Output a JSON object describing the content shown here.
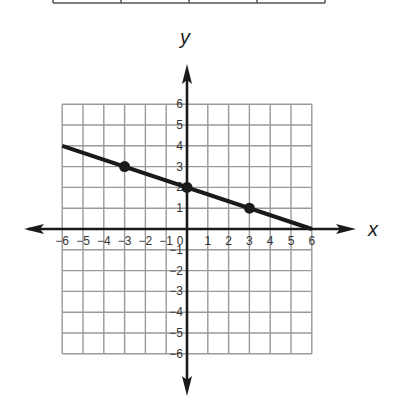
{
  "chart_data": {
    "type": "line",
    "title": "",
    "xlabel": "x",
    "ylabel": "y",
    "xlim": [
      -6,
      6
    ],
    "ylim": [
      -6,
      6
    ],
    "grid": true,
    "x_ticks": [
      -6,
      -5,
      -4,
      -3,
      -2,
      -1,
      0,
      1,
      2,
      3,
      4,
      5,
      6
    ],
    "x_tick_labels": [
      "−6",
      "−5",
      "−4",
      "−3",
      "−2",
      "−1",
      "0",
      "1",
      "2",
      "3",
      "4",
      "5",
      "6"
    ],
    "y_ticks": [
      -6,
      -5,
      -4,
      -3,
      -2,
      -1,
      1,
      2,
      3,
      4,
      5,
      6
    ],
    "y_tick_labels": [
      "−6",
      "−5",
      "−4",
      "−3",
      "−2",
      "−1",
      "1",
      "2",
      "3",
      "4",
      "5",
      "6"
    ],
    "series": [
      {
        "name": "line",
        "equation": "y = -1/3 x + 2",
        "line_from": [
          -6,
          4
        ],
        "line_to": [
          6,
          0
        ],
        "points": [
          [
            -3,
            3
          ],
          [
            0,
            2
          ],
          [
            3,
            1
          ]
        ]
      }
    ]
  },
  "table_fragment": {
    "columns": 4
  }
}
